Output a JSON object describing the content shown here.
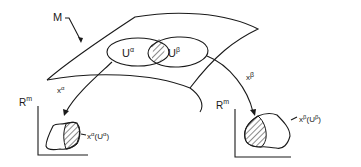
{
  "diagram": {
    "manifold_label": "M",
    "chart_alpha": {
      "region_label_base": "U",
      "region_label_sup": "α",
      "map_label_base": "x",
      "map_label_sup": "α",
      "target_space_base": "R",
      "target_space_sup": "m",
      "image_label_base": "x",
      "image_label_sup": "α",
      "image_label_arg_base": "U",
      "image_label_arg_sup": "α"
    },
    "chart_beta": {
      "region_label_base": "U",
      "region_label_sup": "β",
      "map_label_base": "x",
      "map_label_sup": "β",
      "target_space_base": "R",
      "target_space_sup": "m",
      "image_label_base": "x",
      "image_label_sup": "β",
      "image_label_arg_base": "U",
      "image_label_arg_sup": "β"
    },
    "colors": {
      "ink": "#1a1a1a",
      "background": "#ffffff"
    }
  }
}
